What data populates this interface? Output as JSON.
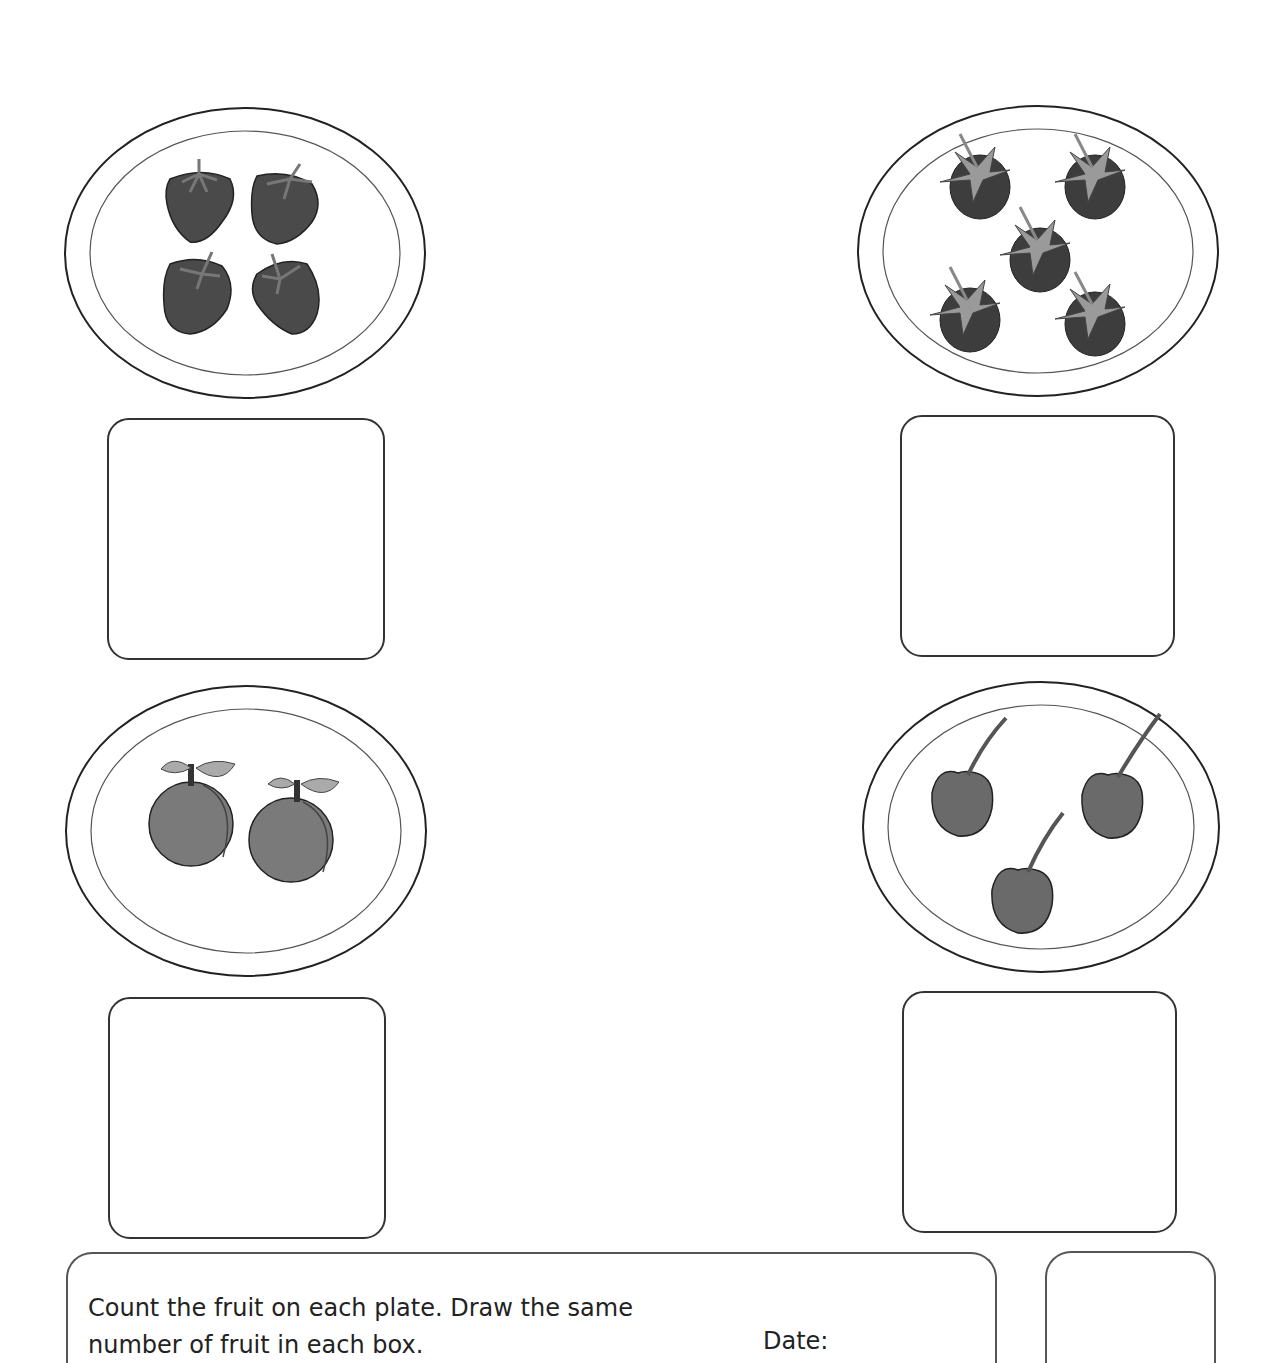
{
  "worksheet": {
    "instructions": "Count the fruit on each plate. Draw the same number of fruit in each box.",
    "date_label": "Date:"
  },
  "plates": [
    {
      "fruit": "strawberry",
      "count": 4
    },
    {
      "fruit": "blackberry",
      "count": 5
    },
    {
      "fruit": "peach",
      "count": 2
    },
    {
      "fruit": "cherry",
      "count": 3
    }
  ],
  "colors": {
    "strawberry": "#4a4a4a",
    "blackberry": "#3d3d3d",
    "leaf": "#9a9a9a",
    "peach": "#7a7a7a",
    "cherry": "#6a6a6a",
    "outline": "#222222"
  }
}
